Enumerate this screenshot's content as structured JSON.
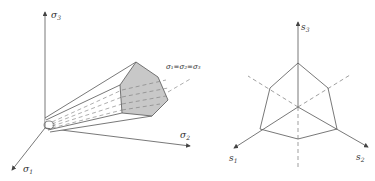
{
  "left_figure": {
    "axis_labels": {
      "sigma3": "σ",
      "sigma3_sub": "3",
      "sigma2": "σ",
      "sigma2_sub": "2",
      "sigma1": "σ",
      "sigma1_sub": "1"
    },
    "hydrostatic_label": "σ₁=σ₂=σ₃",
    "colors": {
      "stroke": "#555555",
      "hex_fill": "#c8c8c8",
      "cone_fill": "#ffffff"
    }
  },
  "right_figure": {
    "axis_labels": {
      "s3": "s",
      "s3_sub": "3",
      "s2": "s",
      "s2_sub": "2",
      "s1": "s",
      "s1_sub": "1"
    }
  }
}
